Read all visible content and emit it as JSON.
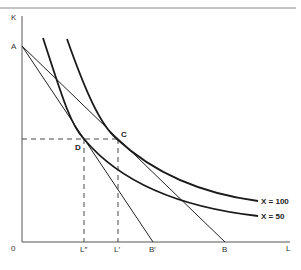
{
  "header": {
    "text": ""
  },
  "axes": {
    "y_label": "K",
    "x_label": "L",
    "origin_label": "0"
  },
  "points": {
    "A": "A",
    "C": "C",
    "D": "D",
    "B": "B",
    "B_prime": "B′",
    "L_prime": "L′",
    "L_double_prime": "L″"
  },
  "curves": {
    "x100": "X = 100",
    "x50": "X = 50"
  },
  "colors": {
    "line": "#1a1a1a",
    "axis": "#444444",
    "dash": "#333333"
  }
}
